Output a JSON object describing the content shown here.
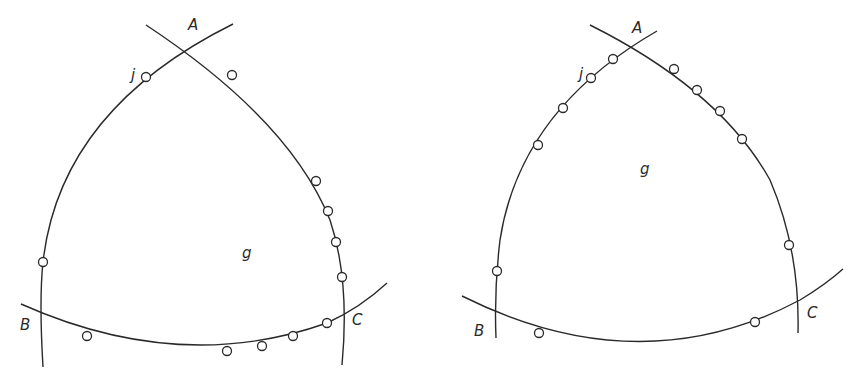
{
  "diagrams": [
    {
      "name": "left-triangle",
      "labels": {
        "A": "A",
        "B": "B",
        "C": "C",
        "j": "j",
        "g": "g"
      },
      "arcs": {
        "AB": "M233,24 Q 60,110 43,262 Q 39,300 43,367",
        "AC": "M146,25 Q 290,120 330,220 Q 350,280 342,365",
        "BC": "M21,304 Q 180,375 327,323 Q 360,308 387,283"
      },
      "nodes": [
        [
          146,
          77
        ],
        [
          43,
          262
        ],
        [
          232,
          75
        ],
        [
          316,
          181
        ],
        [
          328,
          211
        ],
        [
          336,
          242
        ],
        [
          342,
          277
        ],
        [
          87,
          336
        ],
        [
          227,
          351
        ],
        [
          262,
          346
        ],
        [
          293,
          336
        ],
        [
          327,
          323
        ]
      ],
      "label_positions": {
        "A": [
          188,
          30
        ],
        "j": [
          131,
          80
        ],
        "g": [
          242,
          258
        ],
        "B": [
          20,
          330
        ],
        "C": [
          352,
          325
        ]
      }
    },
    {
      "name": "right-triangle",
      "labels": {
        "A": "A",
        "B": "B",
        "C": "C",
        "j": "j",
        "g": "g"
      },
      "arcs": {
        "AB": "M657,31 Q 520,110 500,240 Q 494,290 496,338",
        "AC": "M590,25 Q 720,90 770,180 Q 800,250 798,333",
        "BC": "M462,296 Q 640,385 800,300 Q 825,285 843,269"
      },
      "nodes": [
        [
          613,
          59
        ],
        [
          591,
          78
        ],
        [
          563,
          108
        ],
        [
          538,
          145
        ],
        [
          497,
          271
        ],
        [
          674,
          69
        ],
        [
          697,
          90
        ],
        [
          720,
          111
        ],
        [
          742,
          139
        ],
        [
          789,
          245
        ],
        [
          539,
          333
        ],
        [
          755,
          322
        ]
      ],
      "label_positions": {
        "A": [
          632,
          33
        ],
        "j": [
          579,
          79
        ],
        "g": [
          640,
          174
        ],
        "B": [
          474,
          336
        ],
        "C": [
          807,
          318
        ]
      }
    }
  ]
}
